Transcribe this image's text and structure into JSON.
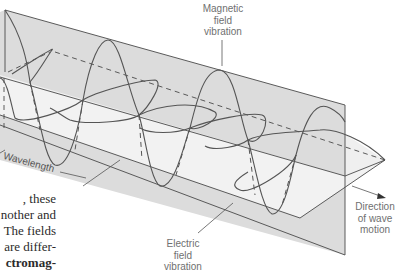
{
  "figure": {
    "colors": {
      "vertical_plane": "#dcdcdc",
      "horizontal_plane": "#f2f2f2",
      "lower_band": "#d6d6d6",
      "wave_stroke": "#555555",
      "label_text": "#6f6f6f"
    },
    "labels": {
      "magnetic": [
        "Magnetic",
        "field",
        "vibration"
      ],
      "electric": [
        "Electric",
        "field",
        "vibration"
      ],
      "direction": [
        "Direction",
        "of wave",
        "motion"
      ],
      "wavelength": "Wavelength"
    }
  },
  "body_text": {
    "lines": [
      ", these",
      "nother and",
      "The fields",
      "are differ-",
      "ctromag-"
    ],
    "bold_line_index": 4
  }
}
